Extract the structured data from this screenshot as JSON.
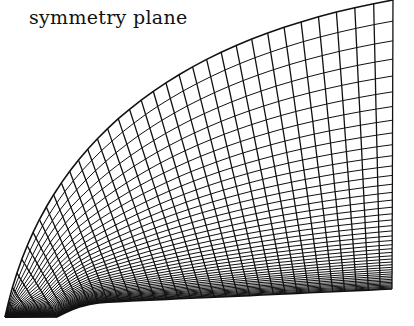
{
  "figure": {
    "label": "symmetry plane",
    "line_color": "#111111",
    "background": "#ffffff"
  },
  "grid": {
    "radial_lines": 34,
    "normal_layers": 44,
    "clustering": 3.2,
    "outer_boundary": {
      "start": [
        5,
        317
      ],
      "end": [
        393,
        0
      ],
      "control": [
        60,
        60
      ]
    },
    "wall": {
      "corner": [
        5,
        317
      ],
      "nose": [
        58,
        317
      ],
      "shoulder": [
        110,
        302
      ],
      "end": [
        392,
        289
      ]
    },
    "outflow_top": [
      393,
      0
    ],
    "outflow_bottom": [
      392,
      289
    ]
  }
}
